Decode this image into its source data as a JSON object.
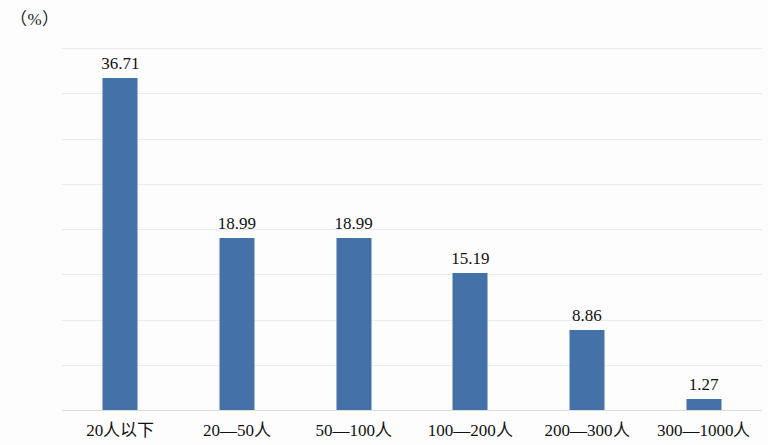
{
  "axis": {
    "unit_label": "（%）",
    "y_ticks": [
      "40.00",
      "35.00",
      "30.00",
      "25.00",
      "20.00",
      "15.00",
      "10.00",
      "5.00",
      "0.00"
    ]
  },
  "colors": {
    "bar": "#4472a8",
    "gridline": "#e9ebed",
    "baseline": "#dcdee0",
    "background": "#fdfdfd",
    "text": "#111111"
  },
  "chart_data": {
    "type": "bar",
    "title": "",
    "xlabel": "",
    "ylabel": "（%）",
    "ylim": [
      0,
      40
    ],
    "ytick_step": 5,
    "grid": true,
    "legend": "none",
    "categories": [
      "20人以下",
      "20—50人",
      "50—100人",
      "100—200人",
      "200—300人",
      "300—1000人"
    ],
    "values": [
      36.71,
      18.99,
      18.99,
      15.19,
      8.86,
      1.27
    ],
    "value_labels": [
      "36.71",
      "18.99",
      "18.99",
      "15.19",
      "8.86",
      "1.27"
    ]
  }
}
